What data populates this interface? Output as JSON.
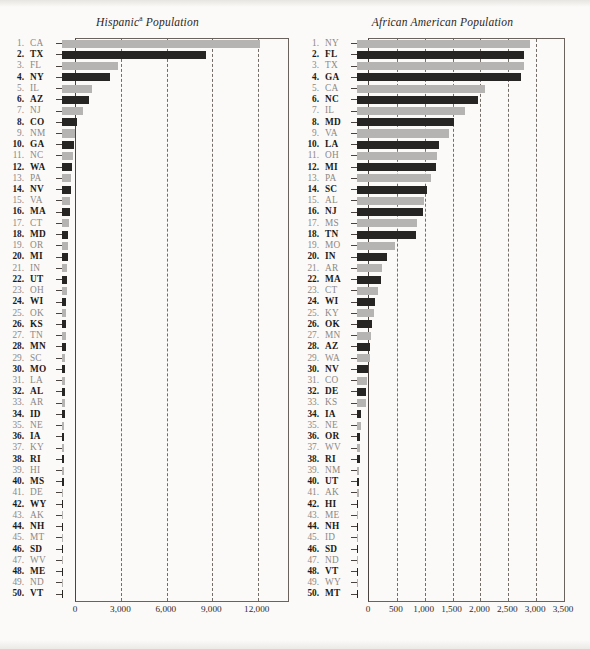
{
  "page": {
    "background": "#fbfaf8",
    "bar_dark_color": "#272524",
    "bar_light_color": "#b6b4b2"
  },
  "chart_data": [
    {
      "type": "bar",
      "orientation": "horizontal",
      "title": "Hispanicᵃ Population",
      "title_main": "Hispanic",
      "title_superscript": "a",
      "title_suffix": " Population",
      "xlabel": "",
      "ylabel": "",
      "xlim": [
        0,
        14000
      ],
      "xticks": [
        0,
        3000,
        6000,
        9000,
        12000
      ],
      "xtick_labels": [
        "0",
        "3,000",
        "6,000",
        "9,000",
        "12,000"
      ],
      "grid": true,
      "grid_style": "dashed-vertical",
      "legend": "none",
      "units": "thousands",
      "categories": [
        "CA",
        "TX",
        "FL",
        "NY",
        "IL",
        "AZ",
        "NJ",
        "CO",
        "NM",
        "GA",
        "NC",
        "WA",
        "PA",
        "NV",
        "VA",
        "MA",
        "CT",
        "MD",
        "OR",
        "MI",
        "IN",
        "UT",
        "OH",
        "WI",
        "OK",
        "KS",
        "TN",
        "MN",
        "SC",
        "MO",
        "LA",
        "AL",
        "AR",
        "ID",
        "NE",
        "IA",
        "KY",
        "RI",
        "HI",
        "MS",
        "DE",
        "WY",
        "AK",
        "NH",
        "MT",
        "SD",
        "WV",
        "ME",
        "ND",
        "VT"
      ],
      "ranks": [
        1,
        2,
        3,
        4,
        5,
        6,
        7,
        8,
        9,
        10,
        11,
        12,
        13,
        14,
        15,
        16,
        17,
        18,
        19,
        20,
        21,
        22,
        23,
        24,
        25,
        26,
        27,
        28,
        29,
        30,
        31,
        32,
        33,
        34,
        35,
        36,
        37,
        38,
        39,
        40,
        41,
        42,
        43,
        44,
        45,
        46,
        47,
        48,
        49,
        50
      ],
      "values": [
        13100,
        9500,
        3700,
        3150,
        1950,
        1800,
        1400,
        1000,
        880,
        770,
        700,
        660,
        600,
        580,
        540,
        500,
        450,
        420,
        400,
        380,
        350,
        320,
        310,
        290,
        280,
        260,
        250,
        240,
        220,
        210,
        195,
        185,
        175,
        170,
        160,
        150,
        140,
        125,
        115,
        105,
        95,
        88,
        80,
        75,
        68,
        62,
        55,
        48,
        42,
        35
      ]
    },
    {
      "type": "bar",
      "orientation": "horizontal",
      "title": "African American Population",
      "title_main": "African American Population",
      "title_superscript": "",
      "title_suffix": "",
      "xlabel": "",
      "ylabel": "",
      "xlim": [
        0,
        3500
      ],
      "xticks": [
        0,
        500,
        1000,
        1500,
        2000,
        2500,
        3000,
        3500
      ],
      "xtick_labels": [
        "0",
        "500",
        "1,000",
        "1,500",
        "2,000",
        "2,500",
        "3,000",
        "3,500"
      ],
      "grid": true,
      "grid_style": "dashed-vertical",
      "legend": "none",
      "units": "thousands",
      "categories": [
        "NY",
        "FL",
        "TX",
        "GA",
        "CA",
        "NC",
        "IL",
        "MD",
        "VA",
        "LA",
        "OH",
        "MI",
        "PA",
        "SC",
        "AL",
        "NJ",
        "MS",
        "TN",
        "MO",
        "IN",
        "AR",
        "MA",
        "CT",
        "WI",
        "KY",
        "OK",
        "MN",
        "AZ",
        "WA",
        "NV",
        "CO",
        "DE",
        "KS",
        "IA",
        "NE",
        "OR",
        "WV",
        "RI",
        "NM",
        "UT",
        "AK",
        "HI",
        "ME",
        "NH",
        "ID",
        "SD",
        "ND",
        "VT",
        "WY",
        "MT"
      ],
      "ranks": [
        1,
        2,
        3,
        4,
        5,
        6,
        7,
        8,
        9,
        10,
        11,
        12,
        13,
        14,
        15,
        16,
        17,
        18,
        19,
        20,
        21,
        22,
        23,
        24,
        25,
        26,
        27,
        28,
        29,
        30,
        31,
        32,
        33,
        34,
        35,
        36,
        37,
        38,
        39,
        40,
        41,
        42,
        43,
        44,
        45,
        46,
        47,
        48,
        49,
        50
      ],
      "values": [
        3100,
        3000,
        3000,
        2950,
        2300,
        2180,
        1940,
        1740,
        1650,
        1480,
        1440,
        1420,
        1320,
        1250,
        1200,
        1180,
        1080,
        1050,
        680,
        540,
        440,
        430,
        380,
        330,
        310,
        270,
        250,
        240,
        230,
        200,
        185,
        160,
        155,
        70,
        68,
        62,
        58,
        50,
        42,
        34,
        27,
        24,
        18,
        16,
        13,
        11,
        9,
        8,
        7,
        6
      ]
    }
  ]
}
